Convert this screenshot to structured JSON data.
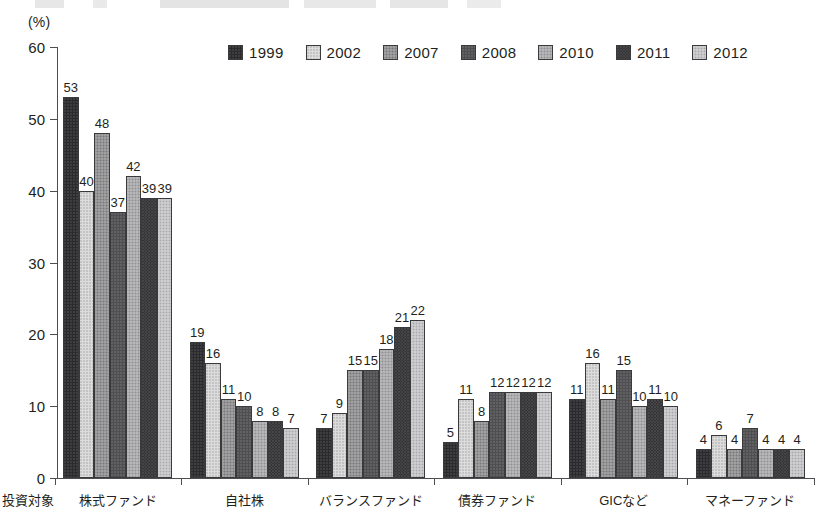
{
  "unit_label": "(%)",
  "axis_name": "投資対象",
  "legend": {
    "items": [
      {
        "label": "1999",
        "key": "1999",
        "color": "#2b2b2d"
      },
      {
        "label": "2002",
        "key": "2002",
        "color": "#dcdcdc"
      },
      {
        "label": "2007",
        "key": "2007",
        "color": "#909092"
      },
      {
        "label": "2008",
        "key": "2008",
        "color": "#4f4f52"
      },
      {
        "label": "2010",
        "key": "2010",
        "color": "#a8a8aa"
      },
      {
        "label": "2011",
        "key": "2011",
        "color": "#343437"
      },
      {
        "label": "2012",
        "key": "2012",
        "color": "#c2c2c4"
      }
    ]
  },
  "chart_data": {
    "type": "bar",
    "title": "",
    "xlabel": "投資対象",
    "ylabel": "(%)",
    "ylim": [
      0,
      60
    ],
    "yticks": [
      0,
      10,
      20,
      30,
      40,
      50,
      60
    ],
    "grid": false,
    "legend_position": "top-center",
    "categories": [
      "株式ファンド",
      "自社株",
      "バランスファンド",
      "債券ファンド",
      "GICなど",
      "マネーファンド"
    ],
    "series": [
      {
        "name": "1999",
        "values": [
          53,
          19,
          7,
          5,
          11,
          4
        ]
      },
      {
        "name": "2002",
        "values": [
          40,
          16,
          9,
          11,
          16,
          6
        ]
      },
      {
        "name": "2007",
        "values": [
          48,
          11,
          15,
          8,
          11,
          4
        ]
      },
      {
        "name": "2008",
        "values": [
          37,
          10,
          15,
          12,
          15,
          7
        ]
      },
      {
        "name": "2010",
        "values": [
          42,
          8,
          18,
          12,
          10,
          4
        ]
      },
      {
        "name": "2011",
        "values": [
          39,
          8,
          21,
          12,
          11,
          4
        ]
      },
      {
        "name": "2012",
        "values": [
          39,
          7,
          22,
          12,
          10,
          4
        ]
      }
    ]
  }
}
